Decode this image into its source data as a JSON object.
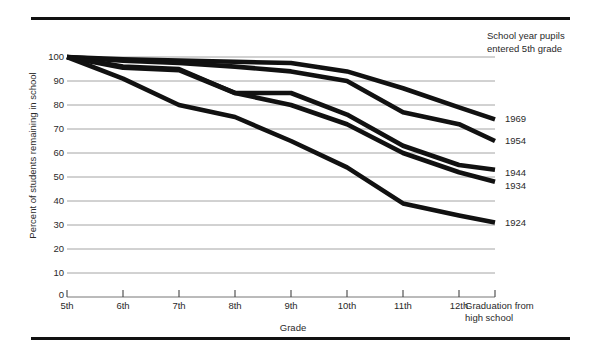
{
  "chart_data": {
    "type": "line",
    "title": "",
    "xlabel": "Grade",
    "ylabel": "Percent of students remaining in school",
    "categories": [
      "5th",
      "6th",
      "7th",
      "8th",
      "9th",
      "10th",
      "11th",
      "12th",
      "Graduation from high school"
    ],
    "ytick_labels": [
      "0",
      "10",
      "20",
      "30",
      "40",
      "50",
      "60",
      "70",
      "80",
      "90",
      "100"
    ],
    "ylim": [
      0,
      100
    ],
    "grid": "horizontal",
    "legend_position": "right-of-plot",
    "legend_title_lines": [
      "School year pupils",
      "entered 5th grade"
    ],
    "series": [
      {
        "name": "1969",
        "values": [
          100,
          99,
          98.5,
          98,
          97.5,
          94,
          87,
          79,
          74
        ]
      },
      {
        "name": "1954",
        "values": [
          100,
          98.5,
          97.5,
          96,
          94,
          90,
          77,
          72,
          65
        ]
      },
      {
        "name": "1944",
        "values": [
          100,
          96,
          95,
          85,
          85,
          76,
          63,
          55,
          53
        ]
      },
      {
        "name": "1934",
        "values": [
          100,
          95.5,
          94.5,
          85,
          80,
          72,
          60,
          52,
          48
        ]
      },
      {
        "name": "1924",
        "values": [
          100,
          91,
          80,
          75,
          65,
          54,
          39,
          34,
          31
        ]
      }
    ]
  },
  "legend": {
    "header_line1": "School year pupils",
    "header_line2": "entered 5th grade",
    "labels": [
      "1969",
      "1954",
      "1944",
      "1934",
      "1924"
    ]
  },
  "axes": {
    "y_title": "Percent of students remaining in school",
    "x_title": "Grade",
    "y_ticks": [
      "100",
      "90",
      "80",
      "70",
      "60",
      "50",
      "40",
      "30",
      "20",
      "10",
      "0"
    ],
    "x_ticks": [
      "5th",
      "6th",
      "7th",
      "8th",
      "9th",
      "10th",
      "11th",
      "12th"
    ],
    "x_last_tick_line1": "Graduation from",
    "x_last_tick_line2": "high school"
  },
  "colors": {
    "line": "#111111",
    "grid": "#9a9a9a",
    "rule": "#111111",
    "text": "#2a2a2a"
  }
}
